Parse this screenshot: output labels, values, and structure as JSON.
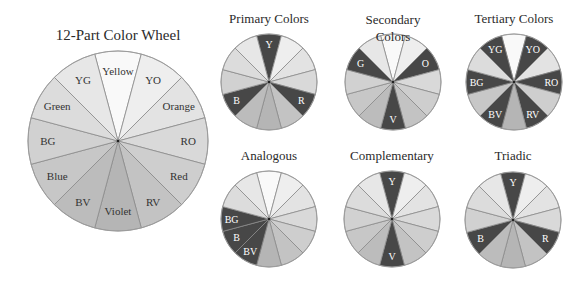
{
  "colors": {
    "dark": "#474747",
    "stroke": "#8a8a8a",
    "shades": [
      "#f9f9f9",
      "#eeeeee",
      "#e3e3e3",
      "#d9d9d9",
      "#cecece",
      "#c3c3c3",
      "#b5b5b5",
      "#bcbcbc",
      "#c7c7c7",
      "#d1d1d1",
      "#dcdcdc",
      "#e7e7e7"
    ],
    "label_dark": "#333333",
    "label_light": "#ffffff"
  },
  "segments": [
    "Yellow",
    "YO",
    "Orange",
    "RO",
    "Red",
    "RV",
    "Violet",
    "BV",
    "Blue",
    "BG",
    "Green",
    "YG"
  ],
  "abbrev": [
    "Y",
    "YO",
    "O",
    "RO",
    "R",
    "RV",
    "V",
    "BV",
    "B",
    "BG",
    "G",
    "YG"
  ],
  "main_wheel": {
    "title": "12-Part Color Wheel",
    "cx": 118,
    "cy": 141,
    "r": 90,
    "labels": [
      "Yellow",
      "YO",
      "Orange",
      "RO",
      "Red",
      "RV",
      "Violet",
      "BV",
      "Blue",
      "BG",
      "Green",
      "YG"
    ]
  },
  "wheels": [
    {
      "id": "primary",
      "title": "Primary Colors",
      "cx": 269,
      "cy": 82,
      "r": 48,
      "highlight": [
        0,
        4,
        8
      ],
      "labels": {
        "0": "Y",
        "4": "R",
        "8": "B"
      }
    },
    {
      "id": "secondary",
      "title": "Secondary Colors",
      "cx": 393,
      "cy": 82,
      "r": 48,
      "highlight": [
        2,
        6,
        10
      ],
      "labels": {
        "2": "O",
        "6": "V",
        "10": "G"
      }
    },
    {
      "id": "tertiary",
      "title": "Tertiary Colors",
      "cx": 514,
      "cy": 82,
      "r": 48,
      "highlight": [
        1,
        3,
        5,
        7,
        9,
        11
      ],
      "labels": {
        "1": "YO",
        "3": "RO",
        "5": "RV",
        "7": "BV",
        "9": "BG",
        "11": "YG"
      }
    },
    {
      "id": "analogous",
      "title": "Analogous",
      "cx": 269,
      "cy": 219,
      "r": 48,
      "highlight": [
        7,
        8,
        9
      ],
      "labels": {
        "7": "BV",
        "8": "B",
        "9": "BG"
      }
    },
    {
      "id": "complementary",
      "title": "Complementary",
      "cx": 392,
      "cy": 219,
      "r": 48,
      "highlight": [
        0,
        6
      ],
      "labels": {
        "0": "Y",
        "6": "V"
      }
    },
    {
      "id": "triadic",
      "title": "Triadic",
      "cx": 513,
      "cy": 220,
      "r": 48,
      "highlight": [
        0,
        4,
        8
      ],
      "labels": {
        "0": "Y",
        "4": "R",
        "8": "B"
      }
    }
  ]
}
